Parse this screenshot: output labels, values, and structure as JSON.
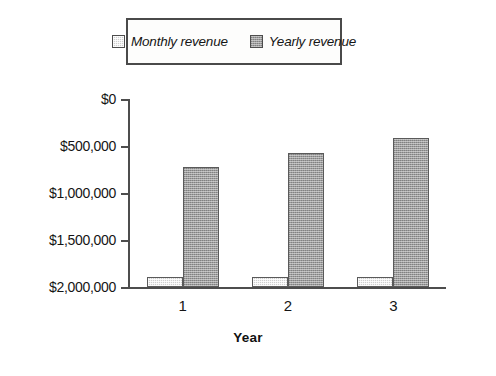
{
  "chart_data": {
    "type": "bar",
    "title": "",
    "subtitle": "",
    "xlabel": "Year",
    "ylabel": "",
    "categories": [
      "1",
      "2",
      "3"
    ],
    "series": [
      {
        "name": "Monthly revenue",
        "values": [
          110000,
          110000,
          110000
        ],
        "color": "#cfcfcf"
      },
      {
        "name": "Yearly revenue",
        "values": [
          1280000,
          1430000,
          1590000
        ],
        "color": "#9c9c9c"
      }
    ],
    "ylim": [
      0,
      2000000
    ],
    "ytick_values": [
      0,
      500000,
      1000000,
      1500000,
      2000000
    ],
    "ytick_labels": [
      "$0",
      "$500,000",
      "$1,000,000",
      "$1,500,000",
      "$2,000,000"
    ],
    "grid": false,
    "legend_position": "top",
    "legend_entries": [
      "Monthly revenue",
      "Yearly revenue"
    ]
  },
  "legend": {
    "items": [
      {
        "label": "Monthly revenue",
        "swatch_name": "legend-swatch-monthly"
      },
      {
        "label": "Yearly revenue",
        "swatch_name": "legend-swatch-yearly"
      }
    ]
  },
  "axes": {
    "x_title": "Year",
    "x_labels": [
      "1",
      "2",
      "3"
    ],
    "y_labels": [
      "$2,000,000",
      "$1,500,000",
      "$1,000,000",
      "$500,000",
      "$0"
    ]
  },
  "colors": {
    "monthly_fill": "#cfcfcf",
    "yearly_fill": "#9c9c9c",
    "axis": "#4d4d4d",
    "legend_border": "#4a4a4a",
    "text": "#151515",
    "background": "#ffffff"
  }
}
